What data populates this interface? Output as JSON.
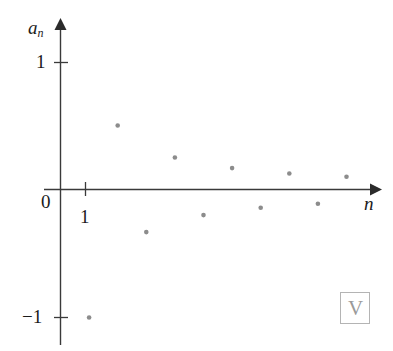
{
  "chart_data": {
    "type": "scatter",
    "title": "",
    "xlabel": "n",
    "ylabel": "a_n",
    "xlim": [
      0,
      11.2
    ],
    "ylim": [
      -1.35,
      1.3
    ],
    "grid": false,
    "legend": null,
    "x": [
      1,
      2,
      3,
      4,
      5,
      6,
      7,
      8,
      9,
      10
    ],
    "y": [
      -1,
      0.5,
      -0.333,
      0.25,
      -0.2,
      0.167,
      -0.143,
      0.125,
      -0.111,
      0.1
    ],
    "points": [
      {
        "n": 1,
        "a_n": -1
      },
      {
        "n": 2,
        "a_n": 0.5
      },
      {
        "n": 3,
        "a_n": -0.333
      },
      {
        "n": 4,
        "a_n": 0.25
      },
      {
        "n": 5,
        "a_n": -0.2
      },
      {
        "n": 6,
        "a_n": 0.167
      },
      {
        "n": 7,
        "a_n": -0.143
      },
      {
        "n": 8,
        "a_n": 0.125
      },
      {
        "n": 9,
        "a_n": -0.111
      },
      {
        "n": 10,
        "a_n": 0.1
      }
    ],
    "x_ticks": [
      {
        "value": 1,
        "label": "1"
      }
    ],
    "y_ticks": [
      {
        "value": 1,
        "label": "1"
      },
      {
        "value": 0,
        "label": "0"
      },
      {
        "value": -1,
        "label": "−1"
      }
    ],
    "marker_color": "#8c8c8c",
    "axis_color": "#3a3a3a"
  },
  "axes": {
    "y_label_main": "a",
    "y_label_sub": "n",
    "x_label": "n"
  },
  "ticks": {
    "y_pos_one": "1",
    "y_neg_one": "−1",
    "origin": "0",
    "x_one": "1"
  },
  "watermark": {
    "text": "V"
  }
}
